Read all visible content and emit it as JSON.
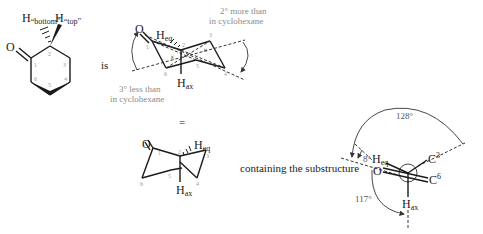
{
  "structure_1": {
    "h_bottom": {
      "atom": "H",
      "subscript": "“bottom”"
    },
    "h_top": {
      "atom": "H",
      "subscript": "“top”"
    },
    "oxygen": "O",
    "ring_numbers": [
      "1",
      "2",
      "3",
      "4",
      "5",
      "6"
    ]
  },
  "connector_is": "is",
  "structure_2": {
    "oxygen": "O",
    "h_eq": {
      "atom": "H",
      "subscript": "eq"
    },
    "h_ax": {
      "atom": "H",
      "subscript": "ax"
    },
    "ring_numbers": [
      "1",
      "2",
      "3",
      "4",
      "5",
      "6"
    ],
    "note_top": [
      "2° more than",
      "in cyclohexane"
    ],
    "note_bottom": [
      "3° less than",
      "in cyclohexane"
    ]
  },
  "connector_equals": "=",
  "structure_3": {
    "oxygen": "O",
    "h_eq": {
      "atom": "H",
      "subscript": "eq"
    },
    "h_ax": {
      "atom": "H",
      "subscript": "ax"
    },
    "ring_numbers": [
      "1",
      "2",
      "3",
      "4",
      "5",
      "6"
    ]
  },
  "connector_containing": "containing the substructure",
  "newman": {
    "oxygen": "O",
    "h_eq": {
      "atom": "H",
      "subscript": "eq"
    },
    "h_ax": {
      "atom": "H",
      "subscript": "ax"
    },
    "c3": {
      "atom": "C",
      "superscript": "3"
    },
    "c6": {
      "atom": "C",
      "superscript": "6"
    },
    "angles": {
      "top": "128°",
      "small": "8°",
      "bottom": "117°"
    }
  }
}
